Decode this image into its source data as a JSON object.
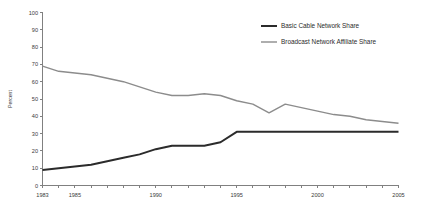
{
  "chart_data": {
    "type": "line",
    "title": "",
    "xlabel": "",
    "ylabel": "Percent",
    "xlim": [
      1983,
      2005
    ],
    "ylim": [
      0,
      100
    ],
    "grid": false,
    "legend_position": "top-right",
    "x": [
      1983,
      1984,
      1985,
      1986,
      1987,
      1988,
      1989,
      1990,
      1991,
      1992,
      1993,
      1994,
      1995,
      1996,
      1997,
      1998,
      1999,
      2000,
      2001,
      2002,
      2003,
      2004,
      2005
    ],
    "xticks": [
      1983,
      1984,
      1985,
      1986,
      1987,
      1988,
      1989,
      1990,
      1991,
      1992,
      1993,
      1994,
      1995,
      1996,
      1997,
      1998,
      1999,
      2000,
      2001,
      2002,
      2003,
      2004,
      2005
    ],
    "xtick_labels": [
      "1983",
      "",
      "1985",
      "",
      "",
      "",
      "",
      "1990",
      "",
      "",
      "",
      "",
      "1995",
      "",
      "",
      "",
      "",
      "2000",
      "",
      "",
      "",
      "",
      "2005"
    ],
    "yticks": [
      0,
      10,
      20,
      30,
      40,
      50,
      60,
      70,
      80,
      90,
      100
    ],
    "ytick_labels": [
      "0",
      "10",
      "20",
      "30",
      "40",
      "50",
      "60",
      "70",
      "80",
      "90",
      "100"
    ],
    "series": [
      {
        "name": "Basic Cable Network Share",
        "color": "#2b2b2b",
        "width": 2,
        "values": [
          9,
          10,
          11,
          12,
          14,
          16,
          18,
          21,
          23,
          23,
          23,
          25,
          31,
          31,
          31,
          31,
          31,
          31,
          31,
          31,
          31,
          31,
          31
        ]
      },
      {
        "name": "Broadcast Network Affiliate Share",
        "color": "#8c8c8c",
        "width": 1.4,
        "values": [
          69,
          66,
          65,
          64,
          62,
          60,
          57,
          54,
          52,
          52,
          53,
          52,
          49,
          47,
          42,
          47,
          45,
          43,
          41,
          40,
          38,
          37,
          36
        ]
      }
    ]
  }
}
